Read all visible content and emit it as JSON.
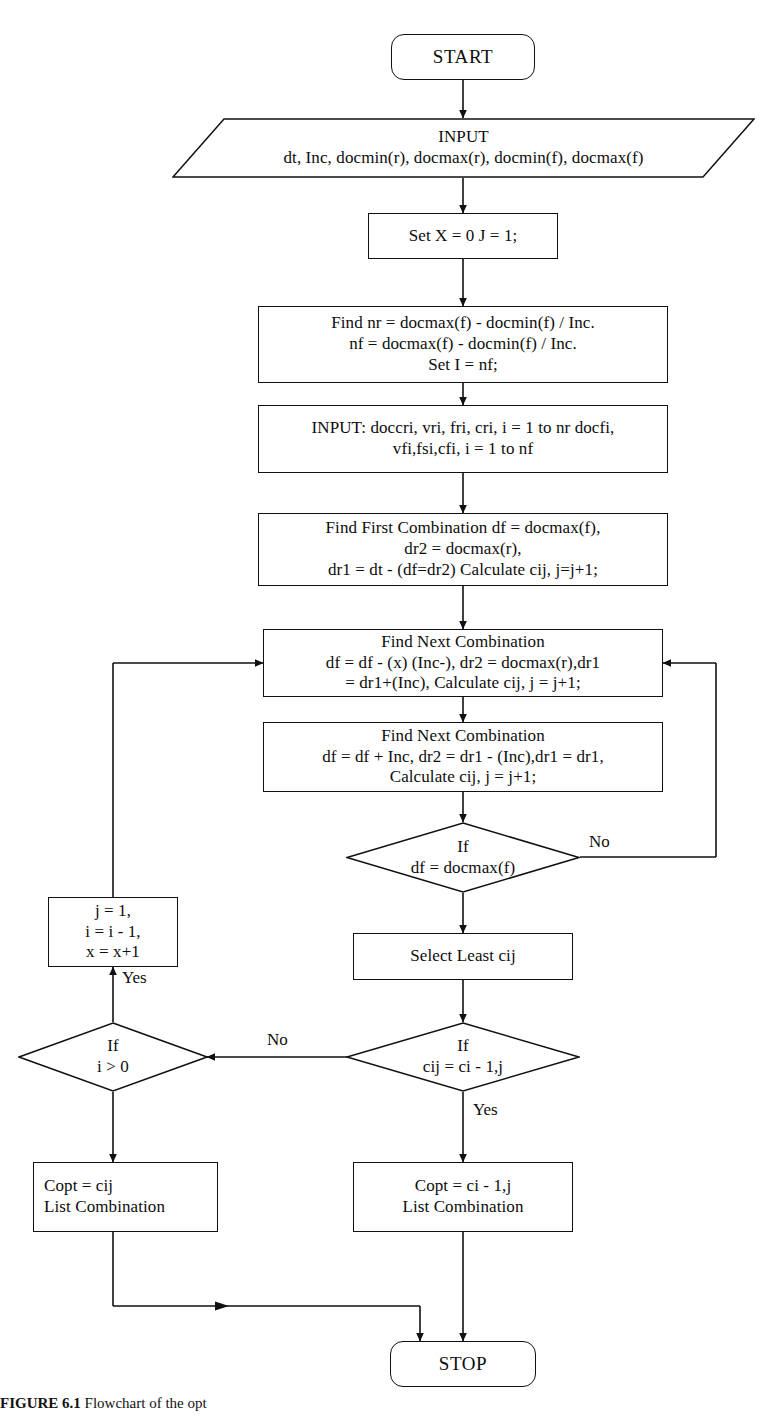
{
  "figure": {
    "type": "flowchart",
    "caption_prefix": "FIGURE 6.1",
    "caption_text": "Flowchart of the opt"
  },
  "nodes": {
    "start": {
      "label": "START",
      "shape": "terminal"
    },
    "input_main": {
      "line1": "INPUT",
      "line2": "dt, Inc, docmin(r), docmax(r), docmin(f), docmax(f)",
      "shape": "parallelogram"
    },
    "set_x_j": {
      "label": "Set X = 0 J = 1;",
      "shape": "process"
    },
    "find_nr": {
      "line1": "Find nr = docmax(f) - docmin(f) / Inc.",
      "line2": "nf = docmax(f) - docmin(f) / Inc.",
      "line3": "Set I = nf;",
      "shape": "process"
    },
    "input_doccri": {
      "line1": "INPUT: doccri, vri, fri, cri, i = 1 to nr docfi,",
      "line2": "vfi,fsi,cfi, i = 1 to nf",
      "shape": "process"
    },
    "find_first": {
      "line1": "Find First Combination df = docmax(f),",
      "line2": "dr2 = docmax(r),",
      "line3": "dr1 = dt - (df=dr2) Calculate cij, j=j+1;",
      "shape": "process"
    },
    "find_next_1": {
      "line1": "Find Next Combination",
      "line2": "df = df - (x) (Inc-), dr2 = docmax(r),dr1",
      "line3": "= dr1+(Inc), Calculate cij, j = j+1;",
      "shape": "process"
    },
    "find_next_2": {
      "line1": "Find Next Combination",
      "line2": "df = df + Inc, dr2 = dr1 - (Inc),dr1 = dr1,",
      "line3": "Calculate cij, j = j+1;",
      "shape": "process"
    },
    "if_df": {
      "line1": "If",
      "line2": "df = docmax(f)",
      "shape": "diamond"
    },
    "reset_j": {
      "line1": "j = 1,",
      "line2": "i = i - 1,",
      "line3": "x = x+1",
      "shape": "process"
    },
    "select_least": {
      "label": "Select Least cij",
      "shape": "process"
    },
    "if_i_gt_0": {
      "line1": "If",
      "line2": "i > 0",
      "shape": "diamond"
    },
    "if_cij": {
      "line1": "If",
      "line2": "cij = ci - 1,j",
      "shape": "diamond"
    },
    "copt_cij": {
      "line1": "Copt = cij",
      "line2": "List Combination",
      "shape": "process"
    },
    "copt_ci_1j": {
      "line1": "Copt = ci - 1,j",
      "line2": "List Combination",
      "shape": "process"
    },
    "stop": {
      "label": "STOP",
      "shape": "terminal"
    }
  },
  "edge_labels": {
    "if_df_no": "No",
    "if_cij_no": "No",
    "if_cij_yes": "Yes",
    "if_i_yes": "Yes"
  },
  "colors": {
    "stroke": "#111111",
    "background": "#ffffff",
    "text": "#0d0d0d"
  }
}
